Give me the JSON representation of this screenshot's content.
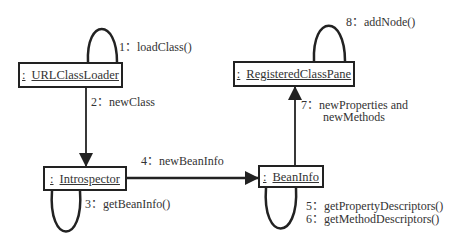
{
  "objects": {
    "url_class_loader": {
      "prefix": ":",
      "name": "URLClassLoader"
    },
    "registered_class_pane": {
      "prefix": ":",
      "name": "RegisteredClassPane"
    },
    "introspector": {
      "prefix": ":",
      "name": "Introspector"
    },
    "bean_info": {
      "prefix": ":",
      "name": "BeanInfo"
    }
  },
  "messages": [
    {
      "num": "1：",
      "text": "loadClass()"
    },
    {
      "num": "2：",
      "text": "newClass"
    },
    {
      "num": "3：",
      "text": "getBeanInfo()"
    },
    {
      "num": "4：",
      "text": "newBeanInfo"
    },
    {
      "num": "5：",
      "text": "getPropertyDescriptors()"
    },
    {
      "num": "6：",
      "text": "getMethodDescriptors()"
    },
    {
      "num": "7：",
      "text": "newProperties and"
    },
    {
      "num": "",
      "text": "newMethods"
    },
    {
      "num": "8：",
      "text": "addNode()"
    }
  ],
  "colors": {
    "line": "#222222",
    "text": "#333333",
    "background": "#ffffff"
  }
}
